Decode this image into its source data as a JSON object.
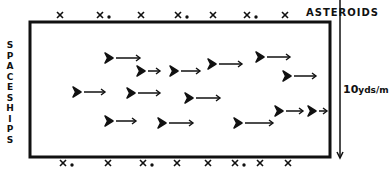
{
  "diagram": {
    "labels": {
      "asteroids": "ASTEROIDS",
      "spaceships": [
        "S",
        "P",
        "A",
        "C",
        "E",
        "S",
        "H",
        "I",
        "P",
        "S"
      ],
      "scale_number": "10",
      "scale_unit": "yds/m"
    },
    "colors": {
      "ink": "#111111",
      "background": "#ffffff"
    },
    "field": {
      "x": 30,
      "y": 22,
      "width": 300,
      "height": 135
    },
    "scale_arrow": {
      "x": 340,
      "y1": 24,
      "y2": 158
    },
    "asteroids_top": [
      {
        "x": 60,
        "dot": false
      },
      {
        "x": 100,
        "dot": true
      },
      {
        "x": 141,
        "dot": false
      },
      {
        "x": 178,
        "dot": true
      },
      {
        "x": 213,
        "dot": false
      },
      {
        "x": 247,
        "dot": true
      },
      {
        "x": 285,
        "dot": false
      }
    ],
    "asteroids_bottom": [
      {
        "x": 63,
        "dot": true
      },
      {
        "x": 108,
        "dot": false
      },
      {
        "x": 143,
        "dot": true
      },
      {
        "x": 177,
        "dot": false
      },
      {
        "x": 208,
        "dot": false
      },
      {
        "x": 235,
        "dot": true
      },
      {
        "x": 260,
        "dot": false
      },
      {
        "x": 288,
        "dot": false
      }
    ],
    "spaceships": [
      {
        "x": 105,
        "y": 58,
        "len": 35
      },
      {
        "x": 137,
        "y": 71,
        "len": 23
      },
      {
        "x": 170,
        "y": 71,
        "len": 30
      },
      {
        "x": 208,
        "y": 64,
        "len": 34
      },
      {
        "x": 256,
        "y": 57,
        "len": 34
      },
      {
        "x": 283,
        "y": 76,
        "len": 33
      },
      {
        "x": 73,
        "y": 92,
        "len": 32
      },
      {
        "x": 127,
        "y": 93,
        "len": 33
      },
      {
        "x": 185,
        "y": 98,
        "len": 35
      },
      {
        "x": 105,
        "y": 121,
        "len": 31
      },
      {
        "x": 158,
        "y": 123,
        "len": 35
      },
      {
        "x": 234,
        "y": 123,
        "len": 39
      },
      {
        "x": 275,
        "y": 111,
        "len": 28
      },
      {
        "x": 308,
        "y": 111,
        "len": 19
      }
    ]
  }
}
